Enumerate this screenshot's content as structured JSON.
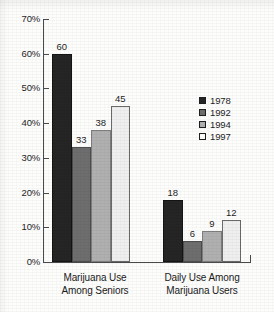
{
  "chart_data": {
    "type": "bar",
    "title": "",
    "xlabel": "",
    "ylabel": "",
    "ylim": [
      0,
      70
    ],
    "ytick_labels": [
      "0%",
      "10%",
      "20%",
      "30%",
      "40%",
      "50%",
      "60%",
      "70%"
    ],
    "ytick_values": [
      0,
      10,
      20,
      30,
      40,
      50,
      60,
      70
    ],
    "grid": false,
    "legend_position": "right",
    "categories": [
      "Marijuana Use Among Seniors",
      "Daily Use Among Marijuana Users"
    ],
    "category_lines": [
      [
        "Marijuana Use",
        "Among Seniors"
      ],
      [
        "Daily Use Among",
        "Marijuana Users"
      ]
    ],
    "series": [
      {
        "name": "1978",
        "color": "#252525",
        "values": [
          60,
          18
        ]
      },
      {
        "name": "1992",
        "color": "#6e6e6e",
        "values": [
          33,
          6
        ]
      },
      {
        "name": "1994",
        "color": "#b0b0b0",
        "values": [
          38,
          9
        ]
      },
      {
        "name": "1997",
        "color": "#efefef",
        "values": [
          45,
          12
        ]
      }
    ]
  },
  "legend": {
    "items": [
      {
        "label": "1978",
        "swatch": "#252525"
      },
      {
        "label": "1992",
        "swatch": "#6e6e6e"
      },
      {
        "label": "1994",
        "swatch": "#b0b0b0"
      },
      {
        "label": "1997",
        "swatch": "#ffffff"
      }
    ]
  },
  "axis": {
    "y_labels": [
      "70%",
      "60%",
      "50%",
      "40%",
      "30%",
      "20%",
      "10%",
      "0%"
    ]
  },
  "groups": [
    {
      "line1": "Marijuana Use",
      "line2": "Among Seniors",
      "values": [
        "60",
        "33",
        "38",
        "45"
      ]
    },
    {
      "line1": "Daily Use Among",
      "line2": "Marijuana Users",
      "values": [
        "18",
        "6",
        "9",
        "12"
      ]
    }
  ]
}
